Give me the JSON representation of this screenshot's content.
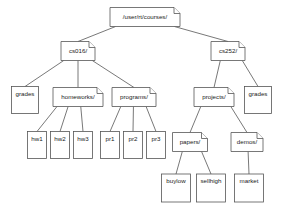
{
  "diagram": {
    "type": "tree",
    "background_color": "#ffffff",
    "node_stroke_color": "#555555",
    "node_fill_color": "#ffffff",
    "label_color": "#1a1a1a",
    "nodes": [
      {
        "id": "root",
        "label": "/user/rt/courses/",
        "kind": "directory",
        "x": 145,
        "y": 17,
        "w": 70,
        "h": 19,
        "font_size": 6.2
      },
      {
        "id": "cs016",
        "label": "cs016/",
        "kind": "directory",
        "x": 78,
        "y": 51,
        "w": 34,
        "h": 19,
        "font_size": 6.2
      },
      {
        "id": "cs252",
        "label": "cs252/",
        "kind": "directory",
        "x": 228,
        "y": 51,
        "w": 34,
        "h": 19,
        "font_size": 6.2
      },
      {
        "id": "grades1",
        "label": "grades",
        "kind": "file",
        "x": 25,
        "y": 100,
        "w": 27,
        "h": 27,
        "font_size": 6.2
      },
      {
        "id": "homeworks",
        "label": "homeworks/",
        "kind": "directory",
        "x": 78,
        "y": 97,
        "w": 50,
        "h": 19,
        "font_size": 6.2
      },
      {
        "id": "programs",
        "label": "programs/",
        "kind": "directory",
        "x": 134,
        "y": 97,
        "w": 44,
        "h": 19,
        "font_size": 6.2
      },
      {
        "id": "projects",
        "label": "projects/",
        "kind": "directory",
        "x": 214,
        "y": 97,
        "w": 40,
        "h": 19,
        "font_size": 6.2
      },
      {
        "id": "grades2",
        "label": "grades",
        "kind": "file",
        "x": 258,
        "y": 100,
        "w": 27,
        "h": 27,
        "font_size": 6.2
      },
      {
        "id": "hw1",
        "label": "hw1",
        "kind": "file",
        "x": 37,
        "y": 145,
        "w": 19,
        "h": 27,
        "font_size": 6.2
      },
      {
        "id": "hw2",
        "label": "hw2",
        "kind": "file",
        "x": 60,
        "y": 145,
        "w": 19,
        "h": 27,
        "font_size": 6.2
      },
      {
        "id": "hw3",
        "label": "hw3",
        "kind": "file",
        "x": 83,
        "y": 145,
        "w": 19,
        "h": 27,
        "font_size": 6.2
      },
      {
        "id": "pr1",
        "label": "pr1",
        "kind": "file",
        "x": 110,
        "y": 145,
        "w": 19,
        "h": 27,
        "font_size": 6.2
      },
      {
        "id": "pr2",
        "label": "pr2",
        "kind": "file",
        "x": 133,
        "y": 145,
        "w": 19,
        "h": 27,
        "font_size": 6.2
      },
      {
        "id": "pr3",
        "label": "pr3",
        "kind": "file",
        "x": 156,
        "y": 145,
        "w": 19,
        "h": 27,
        "font_size": 6.2
      },
      {
        "id": "papers",
        "label": "papers/",
        "kind": "directory",
        "x": 190,
        "y": 142,
        "w": 35,
        "h": 19,
        "font_size": 6.2
      },
      {
        "id": "demos",
        "label": "demos/",
        "kind": "directory",
        "x": 247,
        "y": 142,
        "w": 32,
        "h": 19,
        "font_size": 6.2
      },
      {
        "id": "buylow",
        "label": "buylow",
        "kind": "file",
        "x": 176,
        "y": 188,
        "w": 29,
        "h": 28,
        "font_size": 6.2
      },
      {
        "id": "sellhigh",
        "label": "sellhigh",
        "kind": "file",
        "x": 211,
        "y": 188,
        "w": 29,
        "h": 28,
        "font_size": 6.2
      },
      {
        "id": "market",
        "label": "market",
        "kind": "file",
        "x": 249,
        "y": 188,
        "w": 29,
        "h": 28,
        "font_size": 6.2
      }
    ],
    "edges": [
      {
        "from": "root",
        "to": "cs016"
      },
      {
        "from": "root",
        "to": "cs252"
      },
      {
        "from": "cs016",
        "to": "grades1"
      },
      {
        "from": "cs016",
        "to": "homeworks"
      },
      {
        "from": "cs016",
        "to": "programs"
      },
      {
        "from": "cs252",
        "to": "projects"
      },
      {
        "from": "cs252",
        "to": "grades2"
      },
      {
        "from": "homeworks",
        "to": "hw1"
      },
      {
        "from": "homeworks",
        "to": "hw2"
      },
      {
        "from": "homeworks",
        "to": "hw3"
      },
      {
        "from": "programs",
        "to": "pr1"
      },
      {
        "from": "programs",
        "to": "pr2"
      },
      {
        "from": "programs",
        "to": "pr3"
      },
      {
        "from": "projects",
        "to": "papers"
      },
      {
        "from": "projects",
        "to": "demos"
      },
      {
        "from": "papers",
        "to": "buylow"
      },
      {
        "from": "papers",
        "to": "sellhigh"
      },
      {
        "from": "demos",
        "to": "market"
      }
    ]
  }
}
